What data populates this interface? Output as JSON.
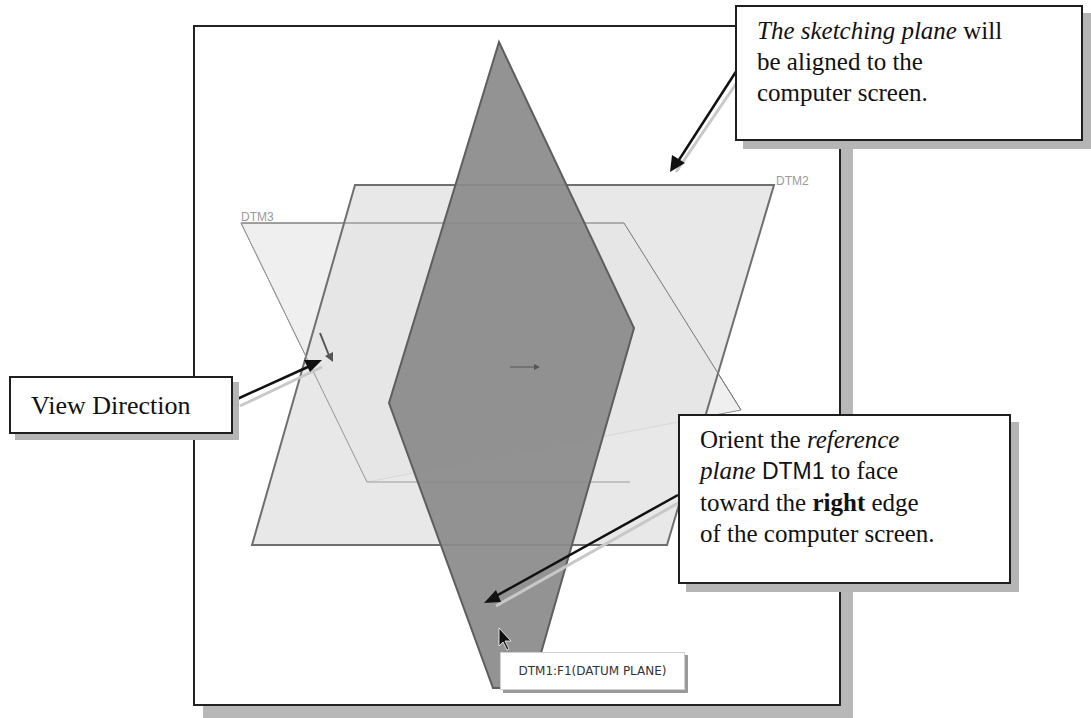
{
  "callouts": {
    "sketching_plane": {
      "line1_italic": "The sketching plane",
      "line1_rest": " will",
      "line2": "be aligned to the",
      "line3": "computer screen."
    },
    "view_direction": {
      "text": "View Direction"
    },
    "orient": {
      "line1_plain": "Orient the ",
      "line1_italic": "reference",
      "line2_italic": "plane",
      "line2_sans": " DTM1",
      "line2_rest": " to face",
      "line3_plain": "toward the ",
      "line3_bold": "right",
      "line3_rest": " edge",
      "line4": "of the computer screen."
    }
  },
  "viewport": {
    "planes": [
      {
        "name": "DTM1",
        "fill": "#8a8a8a",
        "role": "vertical rhombus (sketching plane, edge-on)"
      },
      {
        "name": "DTM2",
        "label": "DTM2",
        "fill": "#e6e6e6"
      },
      {
        "name": "DTM3",
        "label": "DTM3",
        "fill": "#ededed"
      }
    ],
    "tooltip": "DTM1:F1(DATUM PLANE)",
    "cursor_icon": "pointer-arrow-icon",
    "view_direction_icon": "view-direction-arrow-icon"
  },
  "colors": {
    "frame_border": "#222222",
    "shadow": "#b8b8b8",
    "plane_edge": "#6f6f6f",
    "dtm1_fill": "#8a8a8a"
  }
}
